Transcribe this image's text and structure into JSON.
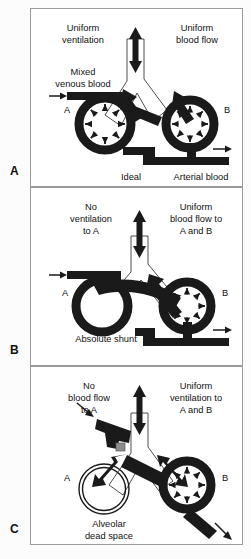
{
  "figure": {
    "panels": [
      {
        "letter": "A",
        "caption": "Ideal",
        "top_left_label": "Uniform ventilation",
        "top_left_lines": [
          "Uniform",
          "ventilation"
        ],
        "top_right_label": "Uniform blood flow",
        "top_right_lines": [
          "Uniform",
          "blood flow"
        ],
        "inflow_label": "Mixed venous blood",
        "inflow_lines": [
          "Mixed",
          "venous blood"
        ],
        "outflow_label": "Arterial blood",
        "alveolus_left_label": "A",
        "alveolus_right_label": "B",
        "state": {
          "ventilation_a": "normal",
          "ventilation_b": "normal",
          "perfusion_a": "normal",
          "perfusion_b": "normal",
          "gas_exchange_a": true,
          "gas_exchange_b": true
        }
      },
      {
        "letter": "B",
        "caption": "Absolute shunt",
        "top_left_label": "No ventilation to A",
        "top_left_lines": [
          "No",
          "ventilation",
          "to A"
        ],
        "top_right_label": "Uniform blood flow to A and B",
        "top_right_lines": [
          "Uniform",
          "blood flow to",
          "A and B"
        ],
        "alveolus_left_label": "A",
        "alveolus_right_label": "B",
        "state": {
          "ventilation_a": "blocked",
          "ventilation_b": "normal",
          "perfusion_a": "normal",
          "perfusion_b": "normal",
          "gas_exchange_a": false,
          "gas_exchange_b": true
        }
      },
      {
        "letter": "C",
        "caption": "Alveolar dead space",
        "caption_lines": [
          "Alveolar",
          "dead space"
        ],
        "top_left_label": "No blood flow to A",
        "top_left_lines": [
          "No",
          "blood flow",
          "to A"
        ],
        "top_right_label": "Uniform ventilation to A and B",
        "top_right_lines": [
          "Uniform",
          "ventilation to",
          "A and B"
        ],
        "alveolus_left_label": "A",
        "alveolus_right_label": "B",
        "state": {
          "ventilation_a": "normal",
          "ventilation_b": "normal",
          "perfusion_a": "blocked",
          "perfusion_b": "normal",
          "gas_exchange_a": false,
          "gas_exchange_b": true
        }
      }
    ]
  },
  "colors": {
    "vessel": "#1a1a1a",
    "airway_fill": "#ffffff",
    "airway_stroke": "#3a3a3a",
    "occlusion": "#8d8d8d",
    "panel_border": "#9a9a9a",
    "background": "#ffffff",
    "text": "#111111"
  }
}
